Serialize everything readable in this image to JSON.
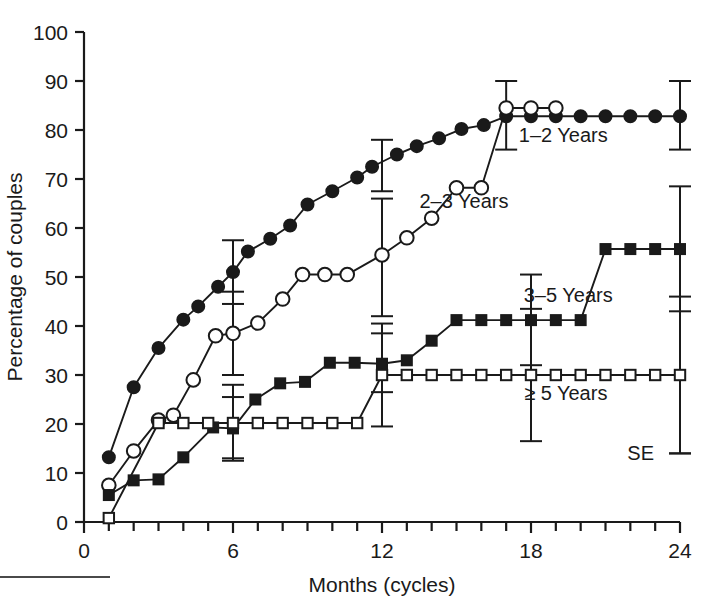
{
  "figure": {
    "kind": "line-chart",
    "footer_rule": "horizontal-rule"
  },
  "axes": {
    "x_title": "Months  (cycles)",
    "y_title": "Percentage of couples",
    "x_ticks": [
      "0",
      "6",
      "12",
      "18",
      "24"
    ],
    "y_ticks": [
      "0",
      "10",
      "20",
      "30",
      "40",
      "50",
      "60",
      "70",
      "80",
      "90",
      "100"
    ]
  },
  "labels": {
    "s1": "1–2 Years",
    "s2": "2–3 Years",
    "s3": "3–5 Years",
    "s4": "≥ 5 Years",
    "se": "SE"
  },
  "colors": {
    "ink": "#1a1a1a",
    "paper": "#ffffff",
    "rule": "#4a4a4a"
  },
  "chart_data": {
    "type": "line",
    "title": "",
    "xlabel": "Months  (cycles)",
    "ylabel": "Percentage of couples",
    "xlim": [
      0,
      24
    ],
    "ylim": [
      0,
      100
    ],
    "xticks": [
      0,
      6,
      12,
      18,
      24
    ],
    "yticks": [
      0,
      10,
      20,
      30,
      40,
      50,
      60,
      70,
      80,
      90,
      100
    ],
    "grid": false,
    "legend": "inline-annotations",
    "series": [
      {
        "name": "1–2 Years",
        "marker": "filled-circle",
        "label_x": 19.3,
        "label_y": 77.5,
        "points": [
          {
            "x": 1.0,
            "y": 13.2
          },
          {
            "x": 2.0,
            "y": 27.5
          },
          {
            "x": 3.0,
            "y": 35.5
          },
          {
            "x": 4.0,
            "y": 41.3
          },
          {
            "x": 4.6,
            "y": 44.0
          },
          {
            "x": 5.4,
            "y": 48.0
          },
          {
            "x": 6.0,
            "y": 51.0
          },
          {
            "x": 6.6,
            "y": 55.2
          },
          {
            "x": 7.5,
            "y": 57.8
          },
          {
            "x": 8.3,
            "y": 60.5
          },
          {
            "x": 9.0,
            "y": 64.8
          },
          {
            "x": 10.0,
            "y": 67.5
          },
          {
            "x": 11.0,
            "y": 70.3
          },
          {
            "x": 11.6,
            "y": 72.5
          },
          {
            "x": 12.6,
            "y": 75.0
          },
          {
            "x": 13.4,
            "y": 76.7
          },
          {
            "x": 14.3,
            "y": 78.3
          },
          {
            "x": 15.2,
            "y": 80.2
          },
          {
            "x": 16.1,
            "y": 81.0
          },
          {
            "x": 17.0,
            "y": 82.8
          },
          {
            "x": 18.0,
            "y": 82.8
          },
          {
            "x": 19.0,
            "y": 82.8
          },
          {
            "x": 20.0,
            "y": 82.8
          },
          {
            "x": 21.0,
            "y": 82.8
          },
          {
            "x": 22.0,
            "y": 82.8
          },
          {
            "x": 23.0,
            "y": 82.8
          },
          {
            "x": 24.0,
            "y": 82.8
          }
        ],
        "errorbars": [
          {
            "x": 6.0,
            "y": 51.0,
            "lo": 44.5,
            "hi": 57.5
          },
          {
            "x": 12.0,
            "y": 72.5,
            "lo": 67.5,
            "hi": 78.0
          },
          {
            "x": 17.0,
            "y": 83.0,
            "lo": 76.0,
            "hi": 90.0
          },
          {
            "x": 24.0,
            "y": 82.8,
            "lo": 76.0,
            "hi": 90.0
          }
        ]
      },
      {
        "name": "2–3 Years",
        "marker": "open-circle",
        "label_x": 15.3,
        "label_y": 64.0,
        "points": [
          {
            "x": 1.0,
            "y": 7.5
          },
          {
            "x": 2.0,
            "y": 14.5
          },
          {
            "x": 3.0,
            "y": 20.8
          },
          {
            "x": 3.6,
            "y": 21.8
          },
          {
            "x": 4.4,
            "y": 29.0
          },
          {
            "x": 5.3,
            "y": 38.0
          },
          {
            "x": 6.0,
            "y": 38.5
          },
          {
            "x": 7.0,
            "y": 40.6
          },
          {
            "x": 8.0,
            "y": 45.5
          },
          {
            "x": 8.8,
            "y": 50.5
          },
          {
            "x": 9.7,
            "y": 50.5
          },
          {
            "x": 10.6,
            "y": 50.5
          },
          {
            "x": 12.0,
            "y": 54.5
          },
          {
            "x": 13.0,
            "y": 58.0
          },
          {
            "x": 14.0,
            "y": 62.0
          },
          {
            "x": 15.0,
            "y": 68.2
          },
          {
            "x": 16.0,
            "y": 68.2
          },
          {
            "x": 17.0,
            "y": 84.5
          },
          {
            "x": 18.0,
            "y": 84.5
          },
          {
            "x": 19.0,
            "y": 84.5
          }
        ],
        "errorbars": [
          {
            "x": 6.0,
            "y": 38.5,
            "lo": 30.0,
            "hi": 47.0
          },
          {
            "x": 12.0,
            "y": 54.5,
            "lo": 42.0,
            "hi": 66.0
          }
        ]
      },
      {
        "name": "3–5 Years",
        "marker": "filled-square",
        "label_x": 19.5,
        "label_y": 45.0,
        "points": [
          {
            "x": 1.0,
            "y": 5.5
          },
          {
            "x": 2.0,
            "y": 8.5
          },
          {
            "x": 3.0,
            "y": 8.7
          },
          {
            "x": 4.0,
            "y": 13.2
          },
          {
            "x": 5.2,
            "y": 19.3
          },
          {
            "x": 6.0,
            "y": 19.1
          },
          {
            "x": 6.9,
            "y": 25.0
          },
          {
            "x": 7.9,
            "y": 28.3
          },
          {
            "x": 8.9,
            "y": 28.6
          },
          {
            "x": 9.9,
            "y": 32.5
          },
          {
            "x": 10.9,
            "y": 32.5
          },
          {
            "x": 12.0,
            "y": 32.3
          },
          {
            "x": 13.0,
            "y": 33.0
          },
          {
            "x": 14.0,
            "y": 37.0
          },
          {
            "x": 15.0,
            "y": 41.2
          },
          {
            "x": 16.0,
            "y": 41.2
          },
          {
            "x": 17.0,
            "y": 41.2
          },
          {
            "x": 18.0,
            "y": 41.2
          },
          {
            "x": 19.0,
            "y": 41.2
          },
          {
            "x": 20.0,
            "y": 41.2
          },
          {
            "x": 21.0,
            "y": 55.7
          },
          {
            "x": 22.0,
            "y": 55.7
          },
          {
            "x": 23.0,
            "y": 55.7
          },
          {
            "x": 24.0,
            "y": 55.7
          }
        ],
        "errorbars": [
          {
            "x": 6.0,
            "y": 19.2,
            "lo": 13.0,
            "hi": 25.5
          },
          {
            "x": 12.0,
            "y": 32.3,
            "lo": 26.5,
            "hi": 38.5
          },
          {
            "x": 18.0,
            "y": 41.2,
            "lo": 32.0,
            "hi": 50.5
          },
          {
            "x": 24.0,
            "y": 55.7,
            "lo": 43.0,
            "hi": 68.5
          }
        ]
      },
      {
        "name": "≥ 5 Years",
        "marker": "open-square",
        "label_x": 19.4,
        "label_y": 25.0,
        "points": [
          {
            "x": 1.0,
            "y": 0.8
          },
          {
            "x": 3.0,
            "y": 20.2
          },
          {
            "x": 4.0,
            "y": 20.2
          },
          {
            "x": 5.0,
            "y": 20.2
          },
          {
            "x": 6.0,
            "y": 20.2
          },
          {
            "x": 7.0,
            "y": 20.2
          },
          {
            "x": 8.0,
            "y": 20.2
          },
          {
            "x": 9.0,
            "y": 20.2
          },
          {
            "x": 10.0,
            "y": 20.2
          },
          {
            "x": 11.0,
            "y": 20.2
          },
          {
            "x": 12.0,
            "y": 30.0
          },
          {
            "x": 13.0,
            "y": 30.0
          },
          {
            "x": 14.0,
            "y": 30.0
          },
          {
            "x": 15.0,
            "y": 30.0
          },
          {
            "x": 16.0,
            "y": 30.0
          },
          {
            "x": 17.0,
            "y": 30.0
          },
          {
            "x": 18.0,
            "y": 30.0
          },
          {
            "x": 19.0,
            "y": 30.0
          },
          {
            "x": 20.0,
            "y": 30.0
          },
          {
            "x": 21.0,
            "y": 30.0
          },
          {
            "x": 22.0,
            "y": 30.0
          },
          {
            "x": 23.0,
            "y": 30.0
          },
          {
            "x": 24.0,
            "y": 30.0
          }
        ],
        "errorbars": [
          {
            "x": 6.0,
            "y": 20.2,
            "lo": 12.5,
            "hi": 28.0
          },
          {
            "x": 12.0,
            "y": 30.0,
            "lo": 19.5,
            "hi": 40.5
          },
          {
            "x": 18.0,
            "y": 30.0,
            "lo": 16.5,
            "hi": 43.5
          },
          {
            "x": 24.0,
            "y": 30.0,
            "lo": 14.0,
            "hi": 46.0
          }
        ]
      }
    ],
    "se_marker": {
      "x": 24.0,
      "y_top": 30.0,
      "y_bottom": 14.0,
      "label": "SE"
    }
  }
}
